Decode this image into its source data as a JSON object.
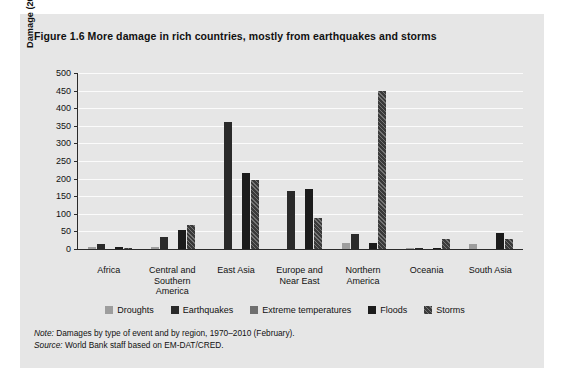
{
  "figure": {
    "title": "Figure 1.6  More damage in rich countries, mostly from earthquakes and storms",
    "note_label": "Note:",
    "note_text": " Damages by type of event and by region, 1970–2010 (February).",
    "source_label": "Source:",
    "source_text": " World Bank staff based on EM-DAT/CRED."
  },
  "chart_data": {
    "type": "bar",
    "title": "More damage in rich countries, mostly from earthquakes and storms",
    "xlabel": "",
    "ylabel": "Damage (2008 $, billions)",
    "ylim": [
      0,
      500
    ],
    "ytick_step": 50,
    "yticks": [
      500,
      450,
      400,
      350,
      300,
      250,
      200,
      150,
      100,
      50,
      0
    ],
    "grid": true,
    "legend_position": "bottom",
    "categories": [
      "Africa",
      "Central and Southern America",
      "East Asia",
      "Europe and Near East",
      "Northern America",
      "Oceania",
      "South Asia"
    ],
    "series": [
      {
        "name": "Droughts",
        "color": "#9d9d9d",
        "values": [
          5,
          5,
          0,
          0,
          18,
          2,
          15
        ]
      },
      {
        "name": "Earthquakes",
        "color": "#2a2a2a",
        "values": [
          13,
          35,
          360,
          165,
          42,
          1,
          0
        ]
      },
      {
        "name": "Extreme temperatures",
        "color": "#6f6f6f",
        "values": [
          0,
          0,
          0,
          0,
          0,
          0,
          0
        ]
      },
      {
        "name": "Floods",
        "color": "#1c1c1c",
        "values": [
          6,
          55,
          215,
          170,
          18,
          1,
          45
        ]
      },
      {
        "name": "Storms",
        "color": "#3a3a3a",
        "values": [
          1,
          68,
          195,
          88,
          450,
          28,
          28
        ]
      }
    ]
  },
  "xlabel_lines": [
    [
      "Africa"
    ],
    [
      "Central and",
      "Southern",
      "America"
    ],
    [
      "East Asia"
    ],
    [
      "Europe and",
      "Near East"
    ],
    [
      "Northern",
      "America"
    ],
    [
      "Oceania"
    ],
    [
      "South Asia"
    ]
  ]
}
